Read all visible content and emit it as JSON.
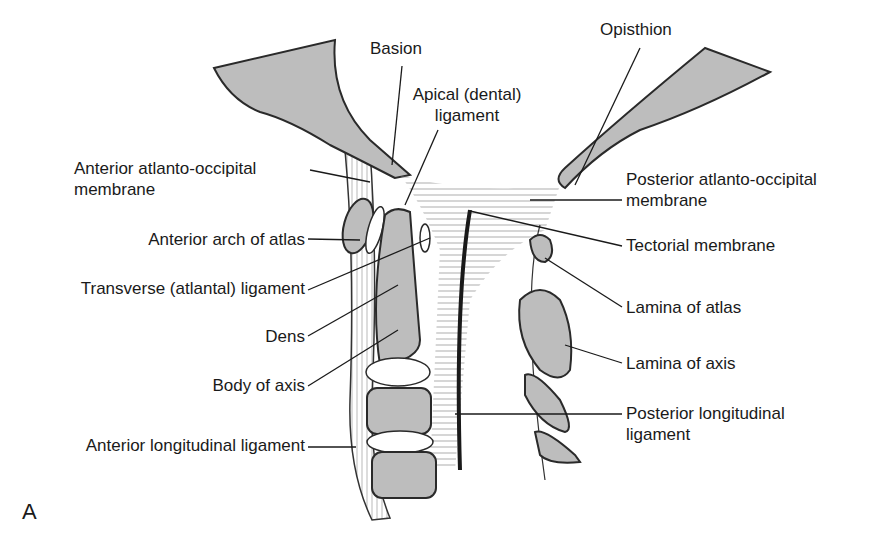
{
  "figure": {
    "panel_letter": "A",
    "colors": {
      "bone_fill": "#bdbdbd",
      "bone_outline": "#2a2a2a",
      "ink": "#1a1a1a",
      "background": "#ffffff"
    },
    "labels": {
      "basion": "Basion",
      "apical_ligament": [
        "Apical (dental)",
        "ligament"
      ],
      "opisthion": "Opisthion",
      "anterior_atlanto_occipital": [
        "Anterior atlanto-occipital",
        "membrane"
      ],
      "posterior_atlanto_occipital": [
        "Posterior atlanto-occipital",
        "membrane"
      ],
      "anterior_arch_atlas": "Anterior arch of atlas",
      "tectorial_membrane": "Tectorial membrane",
      "transverse_ligament": "Transverse (atlantal) ligament",
      "lamina_atlas": "Lamina of atlas",
      "dens": "Dens",
      "lamina_axis": "Lamina of axis",
      "body_axis": "Body of axis",
      "posterior_longitudinal": [
        "Posterior longitudinal",
        "ligament"
      ],
      "anterior_longitudinal": "Anterior longitudinal ligament"
    }
  }
}
